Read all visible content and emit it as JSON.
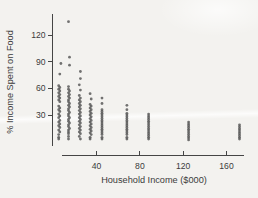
{
  "figure": {
    "title": "",
    "colors": {
      "background": "#f3f2ef",
      "dot": "#545454",
      "axis": "#454545",
      "text": "#3b3b3b"
    }
  },
  "chart_data": {
    "type": "scatter",
    "title": "",
    "xlabel": "Household Income ($000)",
    "ylabel": "% Income Spent on Food",
    "x_ticks": [
      40,
      80,
      120,
      160
    ],
    "y_ticks": [
      30,
      60,
      90,
      120
    ],
    "xlim": [
      0,
      178
    ],
    "ylim": [
      0,
      142
    ],
    "grid": false,
    "legend": "none",
    "points": [
      [
        7,
        88
      ],
      [
        6,
        76
      ],
      [
        5,
        63
      ],
      [
        6,
        61
      ],
      [
        5,
        59
      ],
      [
        6,
        57
      ],
      [
        5,
        55
      ],
      [
        6,
        53
      ],
      [
        5,
        51
      ],
      [
        6,
        49
      ],
      [
        5,
        47
      ],
      [
        6,
        45
      ],
      [
        5,
        40
      ],
      [
        6,
        38
      ],
      [
        5,
        36
      ],
      [
        6,
        34
      ],
      [
        5,
        31
      ],
      [
        6,
        29
      ],
      [
        5,
        27
      ],
      [
        6,
        24
      ],
      [
        5,
        22
      ],
      [
        6,
        20
      ],
      [
        5,
        18
      ],
      [
        6,
        16
      ],
      [
        5,
        13
      ],
      [
        6,
        11
      ],
      [
        5,
        8
      ],
      [
        5,
        5
      ],
      [
        5,
        3
      ],
      [
        14,
        135
      ],
      [
        15,
        95
      ],
      [
        15,
        86
      ],
      [
        14,
        62
      ],
      [
        14,
        59
      ],
      [
        15,
        57
      ],
      [
        14,
        55
      ],
      [
        15,
        53
      ],
      [
        14,
        51
      ],
      [
        15,
        49
      ],
      [
        14,
        47
      ],
      [
        14,
        45
      ],
      [
        15,
        43
      ],
      [
        14,
        41
      ],
      [
        15,
        39
      ],
      [
        14,
        37
      ],
      [
        14,
        35
      ],
      [
        15,
        33
      ],
      [
        14,
        31
      ],
      [
        14,
        29
      ],
      [
        15,
        27
      ],
      [
        14,
        25
      ],
      [
        14,
        23
      ],
      [
        15,
        21
      ],
      [
        14,
        19
      ],
      [
        14,
        17
      ],
      [
        15,
        15
      ],
      [
        14,
        13
      ],
      [
        14,
        11
      ],
      [
        14,
        9
      ],
      [
        14,
        6
      ],
      [
        14,
        3
      ],
      [
        25,
        79
      ],
      [
        25,
        71
      ],
      [
        24,
        64
      ],
      [
        25,
        58
      ],
      [
        24,
        52
      ],
      [
        25,
        49
      ],
      [
        24,
        47
      ],
      [
        25,
        45
      ],
      [
        24,
        43
      ],
      [
        25,
        41
      ],
      [
        24,
        39
      ],
      [
        25,
        37
      ],
      [
        24,
        35
      ],
      [
        25,
        33
      ],
      [
        24,
        31
      ],
      [
        25,
        29
      ],
      [
        24,
        27
      ],
      [
        25,
        25
      ],
      [
        24,
        23
      ],
      [
        25,
        21
      ],
      [
        24,
        19
      ],
      [
        25,
        17
      ],
      [
        24,
        15
      ],
      [
        25,
        13
      ],
      [
        24,
        11
      ],
      [
        25,
        9
      ],
      [
        24,
        6
      ],
      [
        25,
        3
      ],
      [
        34,
        54
      ],
      [
        35,
        48
      ],
      [
        34,
        42
      ],
      [
        35,
        40
      ],
      [
        34,
        38
      ],
      [
        35,
        36
      ],
      [
        34,
        34
      ],
      [
        35,
        32
      ],
      [
        34,
        30
      ],
      [
        35,
        28
      ],
      [
        34,
        26
      ],
      [
        35,
        24
      ],
      [
        34,
        22
      ],
      [
        35,
        20
      ],
      [
        34,
        18
      ],
      [
        35,
        16
      ],
      [
        34,
        14
      ],
      [
        35,
        12
      ],
      [
        34,
        10
      ],
      [
        35,
        8
      ],
      [
        34,
        5
      ],
      [
        34,
        3
      ],
      [
        45,
        49
      ],
      [
        45,
        43
      ],
      [
        45,
        36
      ],
      [
        45,
        34
      ],
      [
        45,
        32
      ],
      [
        45,
        30
      ],
      [
        45,
        28
      ],
      [
        45,
        26
      ],
      [
        45,
        24
      ],
      [
        45,
        22
      ],
      [
        45,
        20
      ],
      [
        45,
        18
      ],
      [
        45,
        16
      ],
      [
        45,
        14
      ],
      [
        45,
        12
      ],
      [
        45,
        10
      ],
      [
        45,
        8
      ],
      [
        45,
        5
      ],
      [
        45,
        3
      ],
      [
        68,
        41
      ],
      [
        68,
        36
      ],
      [
        68,
        32
      ],
      [
        68,
        30
      ],
      [
        68,
        28
      ],
      [
        68,
        26
      ],
      [
        68,
        24
      ],
      [
        68,
        22
      ],
      [
        68,
        20
      ],
      [
        68,
        18
      ],
      [
        68,
        16
      ],
      [
        68,
        14
      ],
      [
        68,
        12
      ],
      [
        68,
        10
      ],
      [
        68,
        8
      ],
      [
        68,
        5
      ],
      [
        68,
        3
      ],
      [
        88,
        31
      ],
      [
        88,
        29
      ],
      [
        88,
        27
      ],
      [
        88,
        25
      ],
      [
        88,
        23
      ],
      [
        88,
        21
      ],
      [
        88,
        19
      ],
      [
        88,
        17
      ],
      [
        88,
        15
      ],
      [
        88,
        13
      ],
      [
        88,
        11
      ],
      [
        88,
        9
      ],
      [
        88,
        7
      ],
      [
        88,
        5
      ],
      [
        88,
        3
      ],
      [
        125,
        22
      ],
      [
        125,
        20
      ],
      [
        125,
        18
      ],
      [
        125,
        16
      ],
      [
        125,
        14
      ],
      [
        125,
        12
      ],
      [
        125,
        10
      ],
      [
        125,
        8
      ],
      [
        125,
        6
      ],
      [
        125,
        4
      ],
      [
        125,
        2
      ],
      [
        172,
        19
      ],
      [
        172,
        17
      ],
      [
        172,
        15
      ],
      [
        172,
        13
      ],
      [
        172,
        11
      ],
      [
        172,
        9
      ],
      [
        172,
        7
      ],
      [
        172,
        5
      ],
      [
        172,
        3
      ]
    ]
  }
}
